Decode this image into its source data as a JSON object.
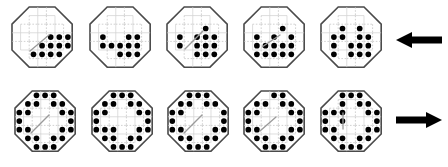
{
  "figure": {
    "canvas": {
      "width": 448,
      "height": 167,
      "background": "#ffffff"
    },
    "grid": {
      "cols": 7,
      "rows": 7,
      "cell_px": 8.6,
      "corner_cut": 2,
      "outline_color": "#4a4a4a",
      "gridline_color": "#cfcfcf",
      "dot_color": "#000000",
      "slash_color": "#9a9a9a"
    },
    "rows": [
      {
        "name": "top-row",
        "label": "Top row sequence",
        "origin_y": 6,
        "arrow": {
          "name": "arrow-left",
          "direction": "left",
          "x": 396,
          "y": 40,
          "length": 46,
          "color": "#000000"
        },
        "panels": [
          {
            "name": "panel-top-1",
            "x": 11,
            "slash": {
              "x1": 18,
              "y1": 44,
              "x2": 37,
              "y2": 28
            },
            "dots": [
              [
                2,
                3
              ],
              [
                3,
                3
              ],
              [
                4,
                3
              ],
              [
                4,
                2
              ],
              [
                5,
                2
              ],
              [
                5,
                3
              ],
              [
                2,
                4
              ],
              [
                3,
                4
              ],
              [
                4,
                4
              ],
              [
                5,
                4
              ],
              [
                1,
                4
              ],
              [
                3,
                2
              ]
            ]
          },
          {
            "name": "panel-top-2",
            "x": 89,
            "slash": null,
            "dots": [
              [
                0,
                2
              ],
              [
                0,
                3
              ],
              [
                1,
                3
              ],
              [
                2,
                3
              ],
              [
                3,
                2
              ],
              [
                4,
                2
              ],
              [
                3,
                3
              ],
              [
                4,
                3
              ],
              [
                3,
                4
              ],
              [
                4,
                4
              ],
              [
                2,
                4
              ]
            ]
          },
          {
            "name": "panel-top-3",
            "x": 166,
            "slash": {
              "x1": 18,
              "y1": 42,
              "x2": 36,
              "y2": 24
            },
            "dots": [
              [
                3,
                1
              ],
              [
                0,
                2
              ],
              [
                0,
                3
              ],
              [
                2,
                2
              ],
              [
                3,
                2
              ],
              [
                4,
                2
              ],
              [
                2,
                3
              ],
              [
                3,
                3
              ],
              [
                4,
                3
              ],
              [
                2,
                4
              ],
              [
                3,
                4
              ],
              [
                4,
                4
              ]
            ]
          },
          {
            "name": "panel-top-4",
            "x": 243,
            "slash": {
              "x1": 18,
              "y1": 40,
              "x2": 36,
              "y2": 28
            },
            "dots": [
              [
                3,
                1
              ],
              [
                0,
                2
              ],
              [
                0,
                3
              ],
              [
                0,
                4
              ],
              [
                2,
                2
              ],
              [
                4,
                2
              ],
              [
                1,
                3
              ],
              [
                2,
                3
              ],
              [
                3,
                3
              ],
              [
                4,
                3
              ],
              [
                1,
                4
              ],
              [
                2,
                4
              ],
              [
                3,
                4
              ],
              [
                4,
                4
              ]
            ]
          },
          {
            "name": "panel-top-5",
            "x": 320,
            "slash": null,
            "dots": [
              [
                1,
                1
              ],
              [
                3,
                1
              ],
              [
                0,
                2
              ],
              [
                1,
                2
              ],
              [
                3,
                2
              ],
              [
                4,
                2
              ],
              [
                0,
                3
              ],
              [
                2,
                3
              ],
              [
                3,
                3
              ],
              [
                4,
                3
              ],
              [
                0,
                4
              ],
              [
                2,
                4
              ],
              [
                3,
                4
              ],
              [
                4,
                4
              ]
            ]
          }
        ]
      },
      {
        "name": "bottom-row",
        "label": "Bottom row sequence",
        "origin_y": 90,
        "arrow": {
          "name": "arrow-right",
          "direction": "right",
          "x": 396,
          "y": 120,
          "length": 46,
          "color": "#000000"
        },
        "panels": [
          {
            "name": "panel-bottom-1",
            "x": 14,
            "slash": {
              "x1": 16,
              "y1": 42,
              "x2": 34,
              "y2": 24
            },
            "ring": true,
            "dots": []
          },
          {
            "name": "panel-bottom-2",
            "x": 91,
            "slash": null,
            "ring": true,
            "dots": [
              [
                1,
                3
              ]
            ]
          },
          {
            "name": "panel-bottom-3",
            "x": 167,
            "slash": {
              "x1": 16,
              "y1": 42,
              "x2": 34,
              "y2": 24
            },
            "ring": true,
            "ring_gaps": [
              [
                5,
                2
              ],
              [
                5,
                3
              ]
            ],
            "dots": []
          },
          {
            "name": "panel-bottom-4",
            "x": 243,
            "slash": {
              "x1": 16,
              "y1": 40,
              "x2": 32,
              "y2": 26
            },
            "ring": true,
            "ring_gaps": [
              [
                2,
                0
              ],
              [
                3,
                5
              ]
            ],
            "dots": []
          },
          {
            "name": "panel-bottom-5",
            "x": 320,
            "slash": {
              "x1": 22,
              "y1": 22,
              "x2": 22,
              "y2": 38
            },
            "ring": true,
            "ring_gaps": [
              [
                1,
                1
              ]
            ],
            "dots": [
              [
                1,
                1
              ],
              [
                1,
                2
              ]
            ]
          }
        ]
      }
    ]
  }
}
